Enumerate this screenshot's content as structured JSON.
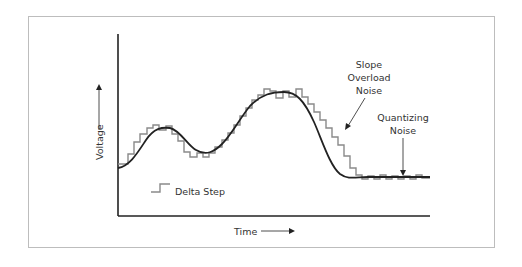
{
  "diagram": {
    "x_axis_label": "Time",
    "y_axis_label": "Voltage",
    "legend": {
      "label": "Delta Step"
    },
    "annotations": {
      "slope_overload": [
        "Slope",
        "Overload",
        "Noise"
      ],
      "quantizing": [
        "Quantizing",
        "Noise"
      ]
    },
    "colors": {
      "signal": "#222222",
      "staircase": "#8a8a8a",
      "axes": "#222222",
      "frame": "#bdbdbd"
    }
  }
}
